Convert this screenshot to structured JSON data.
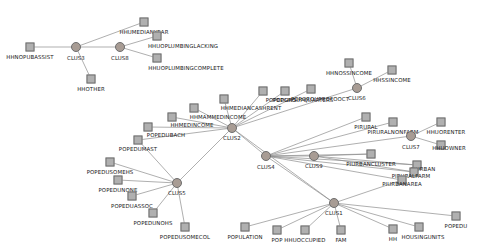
{
  "figure": {
    "type": "network-graph",
    "title": "",
    "width": 487,
    "height": 246,
    "background_color": "#ffffff",
    "variable_node_color": "#b0b0b0",
    "variable_node_border": "#6e6e6e",
    "cluster_node_color": "#a89c94",
    "edge_color": "#8c8c8c"
  },
  "nodes": [
    {
      "id": "HHUMEDIANYEAR",
      "label": "HHUMEDIANYEAR",
      "kind": "variable",
      "x": 144,
      "y": 22,
      "lx": 144,
      "ly": 30
    },
    {
      "id": "HHNOPUBASSIST",
      "label": "HHNOPUBASSIST",
      "kind": "variable",
      "x": 30,
      "y": 47,
      "lx": 30,
      "ly": 55
    },
    {
      "id": "CLUS3",
      "label": "CLUS3",
      "kind": "cluster",
      "x": 76,
      "y": 47,
      "lx": 76,
      "ly": 56
    },
    {
      "id": "CLUS8",
      "label": "CLUS8",
      "kind": "cluster",
      "x": 120,
      "y": 47,
      "lx": 120,
      "ly": 56
    },
    {
      "id": "HHUOPLUMBINGLACKING",
      "label": "HHUOPLUMBINGLACKING",
      "kind": "variable",
      "x": 157,
      "y": 36,
      "lx": 183,
      "ly": 44
    },
    {
      "id": "HHUOPLUMBINGCOMPLETE",
      "label": "HHUOPLUMBINGCOMPLETE",
      "kind": "variable",
      "x": 157,
      "y": 58,
      "lx": 186,
      "ly": 66
    },
    {
      "id": "HHOTHER",
      "label": "HHOTHER",
      "kind": "variable",
      "x": 91,
      "y": 79,
      "lx": 91,
      "ly": 87
    },
    {
      "id": "CLUS2",
      "label": "CLUS2",
      "kind": "cluster",
      "x": 232,
      "y": 128,
      "lx": 232,
      "ly": 136
    },
    {
      "id": "HHMEDIANCASHRENT",
      "label": "HHMEDIANCASHRENT",
      "kind": "variable",
      "x": 224,
      "y": 99,
      "lx": 251,
      "ly": 106
    },
    {
      "id": "HHMAMMEDINCOME",
      "label": "HHMAMMEDINCOME",
      "kind": "variable",
      "x": 194,
      "y": 108,
      "lx": 218,
      "ly": 115
    },
    {
      "id": "HHMEDINCOME",
      "label": "HHMEDINCOME",
      "kind": "variable",
      "x": 172,
      "y": 117,
      "lx": 192,
      "ly": 123
    },
    {
      "id": "POPEDUBACH",
      "label": "POPEDUBACH",
      "kind": "variable",
      "x": 148,
      "y": 127,
      "lx": 166,
      "ly": 133
    },
    {
      "id": "POPEDUMAST",
      "label": "POPEDUMAST",
      "kind": "variable",
      "x": 138,
      "y": 140,
      "lx": 138,
      "ly": 147
    },
    {
      "id": "POPEDUHS",
      "label": "POPEDUHS",
      "kind": "variable",
      "x": 263,
      "y": 91,
      "lx": 281,
      "ly": 98
    },
    {
      "id": "POPGROUPQUARTERS",
      "label": "POPGROUPQUARTERS",
      "kind": "variable",
      "x": 285,
      "y": 91,
      "lx": 303,
      "ly": 98
    },
    {
      "id": "POPGROUPROFOOCT",
      "label": "POPGROUPROFOOCT",
      "kind": "variable",
      "x": 311,
      "y": 89,
      "lx": 320,
      "ly": 97
    },
    {
      "id": "HHNOSSINCOME",
      "label": "HHNOSSINCOME",
      "kind": "variable",
      "x": 349,
      "y": 63,
      "lx": 349,
      "ly": 71
    },
    {
      "id": "HHSSINCOME",
      "label": "HHSSINCOME",
      "kind": "variable",
      "x": 392,
      "y": 70,
      "lx": 392,
      "ly": 78
    },
    {
      "id": "CLUS6",
      "label": "CLUS6",
      "kind": "cluster",
      "x": 357,
      "y": 88,
      "lx": 357,
      "ly": 96
    },
    {
      "id": "CLUS4",
      "label": "CLUS4",
      "kind": "cluster",
      "x": 266,
      "y": 156,
      "lx": 266,
      "ly": 165
    },
    {
      "id": "CLUS9",
      "label": "CLUS9",
      "kind": "cluster",
      "x": 314,
      "y": 156,
      "lx": 314,
      "ly": 164
    },
    {
      "id": "PIRURAL",
      "label": "PIRURAL",
      "kind": "variable",
      "x": 366,
      "y": 117,
      "lx": 366,
      "ly": 125
    },
    {
      "id": "PIRURALNONFARM",
      "label": "PIRURALNONFARM",
      "kind": "variable",
      "x": 393,
      "y": 122,
      "lx": 393,
      "ly": 130
    },
    {
      "id": "CLUS7",
      "label": "CLUS7",
      "kind": "cluster",
      "x": 411,
      "y": 136,
      "lx": 411,
      "ly": 145
    },
    {
      "id": "HHUORENTER",
      "label": "HHUORENTER",
      "kind": "variable",
      "x": 441,
      "y": 122,
      "lx": 446,
      "ly": 130
    },
    {
      "id": "HHUOWNER",
      "label": "HHUOWNER",
      "kind": "variable",
      "x": 441,
      "y": 145,
      "lx": 449,
      "ly": 146
    },
    {
      "id": "PIURBANCLUSTER",
      "label": "PIURBANCLUSTER",
      "kind": "variable",
      "x": 371,
      "y": 154,
      "lx": 371,
      "ly": 162
    },
    {
      "id": "PIURBAN",
      "label": "PIURBAN",
      "kind": "variable",
      "x": 417,
      "y": 165,
      "lx": 423,
      "ly": 167
    },
    {
      "id": "PIRURALFARM",
      "label": "PIRURALFARM",
      "kind": "variable",
      "x": 414,
      "y": 172,
      "lx": 411,
      "ly": 174
    },
    {
      "id": "PIURBANAREA",
      "label": "PIURBANAREA",
      "kind": "variable",
      "x": 402,
      "y": 180,
      "lx": 402,
      "ly": 182
    },
    {
      "id": "CLUS5",
      "label": "CLUS5",
      "kind": "cluster",
      "x": 177,
      "y": 183,
      "lx": 177,
      "ly": 191
    },
    {
      "id": "POPEDUSOMEHS",
      "label": "POPEDUSOMEHS",
      "kind": "variable",
      "x": 110,
      "y": 162,
      "lx": 110,
      "ly": 170
    },
    {
      "id": "POPEDUNONE",
      "label": "POPEDUNONE",
      "kind": "variable",
      "x": 118,
      "y": 180,
      "lx": 118,
      "ly": 188
    },
    {
      "id": "POPEDUASSOC",
      "label": "POPEDUASSOC",
      "kind": "variable",
      "x": 132,
      "y": 196,
      "lx": 132,
      "ly": 204
    },
    {
      "id": "POPEDUNOHS",
      "label": "POPEDUNOHS",
      "kind": "variable",
      "x": 153,
      "y": 213,
      "lx": 153,
      "ly": 221
    },
    {
      "id": "POPEDUSOMECOL",
      "label": "POPEDUSOMECOL",
      "kind": "variable",
      "x": 185,
      "y": 227,
      "lx": 185,
      "ly": 235
    },
    {
      "id": "CLUS1",
      "label": "CLUS1",
      "kind": "cluster",
      "x": 334,
      "y": 203,
      "lx": 334,
      "ly": 211
    },
    {
      "id": "POPULATION",
      "label": "POPULATION",
      "kind": "variable",
      "x": 245,
      "y": 227,
      "lx": 245,
      "ly": 235
    },
    {
      "id": "POP",
      "label": "POP",
      "kind": "variable",
      "x": 277,
      "y": 230,
      "lx": 277,
      "ly": 238
    },
    {
      "id": "HHUOCCUPIED",
      "label": "HHUOCCUPIED",
      "kind": "variable",
      "x": 305,
      "y": 230,
      "lx": 305,
      "ly": 238
    },
    {
      "id": "FAM",
      "label": "FAM",
      "kind": "variable",
      "x": 341,
      "y": 230,
      "lx": 341,
      "ly": 238
    },
    {
      "id": "HH",
      "label": "HH",
      "kind": "variable",
      "x": 393,
      "y": 229,
      "lx": 393,
      "ly": 237
    },
    {
      "id": "HOUSINGUNITS",
      "label": "HOUSINGUNITS",
      "kind": "variable",
      "x": 419,
      "y": 227,
      "lx": 423,
      "ly": 235
    },
    {
      "id": "POPEDU",
      "label": "POPEDU",
      "kind": "variable",
      "x": 456,
      "y": 216,
      "lx": 456,
      "ly": 224
    }
  ],
  "edges": [
    {
      "source": "CLUS3",
      "target": "HHUMEDIANYEAR"
    },
    {
      "source": "CLUS3",
      "target": "HHNOPUBASSIST"
    },
    {
      "source": "CLUS3",
      "target": "HHOTHER"
    },
    {
      "source": "CLUS3",
      "target": "CLUS8"
    },
    {
      "source": "CLUS8",
      "target": "HHUOPLUMBINGLACKING"
    },
    {
      "source": "CLUS8",
      "target": "HHUOPLUMBINGCOMPLETE"
    },
    {
      "source": "CLUS2",
      "target": "HHMEDIANCASHRENT"
    },
    {
      "source": "CLUS2",
      "target": "HHMAMMEDINCOME"
    },
    {
      "source": "CLUS2",
      "target": "HHMEDINCOME"
    },
    {
      "source": "CLUS2",
      "target": "POPEDUBACH"
    },
    {
      "source": "CLUS2",
      "target": "POPEDUMAST"
    },
    {
      "source": "CLUS2",
      "target": "POPEDUHS"
    },
    {
      "source": "CLUS2",
      "target": "POPGROUPQUARTERS"
    },
    {
      "source": "CLUS2",
      "target": "POPGROUPROFOOCT"
    },
    {
      "source": "CLUS2",
      "target": "CLUS6"
    },
    {
      "source": "CLUS2",
      "target": "CLUS4"
    },
    {
      "source": "CLUS2",
      "target": "CLUS5"
    },
    {
      "source": "CLUS2",
      "target": "CLUS1"
    },
    {
      "source": "CLUS6",
      "target": "HHNOSSINCOME"
    },
    {
      "source": "CLUS6",
      "target": "HHSSINCOME"
    },
    {
      "source": "CLUS4",
      "target": "CLUS9"
    },
    {
      "source": "CLUS4",
      "target": "PIRURAL"
    },
    {
      "source": "CLUS4",
      "target": "PIRURALNONFARM"
    },
    {
      "source": "CLUS4",
      "target": "CLUS7"
    },
    {
      "source": "CLUS4",
      "target": "PIURBANCLUSTER"
    },
    {
      "source": "CLUS4",
      "target": "PIURBAN"
    },
    {
      "source": "CLUS4",
      "target": "PIRURALFARM"
    },
    {
      "source": "CLUS4",
      "target": "PIURBANAREA"
    },
    {
      "source": "CLUS4",
      "target": "CLUS1"
    },
    {
      "source": "CLUS9",
      "target": "PIURBANCLUSTER"
    },
    {
      "source": "CLUS9",
      "target": "PIURBAN"
    },
    {
      "source": "CLUS9",
      "target": "PIRURALFARM"
    },
    {
      "source": "CLUS7",
      "target": "HHUORENTER"
    },
    {
      "source": "CLUS7",
      "target": "HHUOWNER"
    },
    {
      "source": "CLUS5",
      "target": "POPEDUSOMEHS"
    },
    {
      "source": "CLUS5",
      "target": "POPEDUNONE"
    },
    {
      "source": "CLUS5",
      "target": "POPEDUASSOC"
    },
    {
      "source": "CLUS5",
      "target": "POPEDUNOHS"
    },
    {
      "source": "CLUS5",
      "target": "POPEDUSOMECOL"
    },
    {
      "source": "CLUS1",
      "target": "POPULATION"
    },
    {
      "source": "CLUS1",
      "target": "POP"
    },
    {
      "source": "CLUS1",
      "target": "HHUOCCUPIED"
    },
    {
      "source": "CLUS1",
      "target": "FAM"
    },
    {
      "source": "CLUS1",
      "target": "HH"
    },
    {
      "source": "CLUS1",
      "target": "HOUSINGUNITS"
    },
    {
      "source": "CLUS1",
      "target": "POPEDU"
    },
    {
      "source": "CLUS1",
      "target": "PIURBANAREA"
    },
    {
      "source": "CLUS5",
      "target": "POPEDUMAST"
    }
  ]
}
